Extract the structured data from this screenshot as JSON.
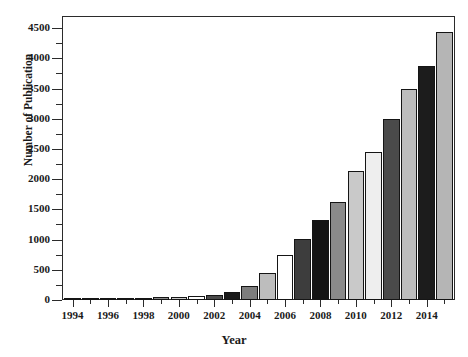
{
  "chart_data": {
    "type": "bar",
    "title": "",
    "xlabel": "Year",
    "ylabel": "Number of Publication",
    "categories": [
      1994,
      1995,
      1996,
      1997,
      1998,
      1999,
      2000,
      2001,
      2002,
      2003,
      2004,
      2005,
      2006,
      2007,
      2008,
      2009,
      2010,
      2011,
      2012,
      2013,
      2014,
      2015
    ],
    "values": [
      10,
      12,
      18,
      22,
      26,
      45,
      55,
      70,
      90,
      130,
      240,
      450,
      750,
      1010,
      1320,
      1620,
      2130,
      2450,
      2990,
      3490,
      3870,
      4430
    ],
    "bar_colors": [
      "#666666",
      "#b3b3b3",
      "#ffffff",
      "#3d3d3d",
      "#111111",
      "#8a8a8a",
      "#c9c9c9",
      "#ffffff",
      "#4a4a4a",
      "#1a1a1a",
      "#7d7d7d",
      "#bdbdbd",
      "#ffffff",
      "#3d3d3d",
      "#141414",
      "#8a8a8a",
      "#c9c9c9",
      "#eeeeee",
      "#4a4a4a",
      "#bdbdbd",
      "#1c1c1c",
      "#b5b5b5"
    ],
    "ylim": [
      0,
      4700
    ],
    "yticks": [
      0,
      500,
      1000,
      1500,
      2000,
      2500,
      3000,
      3500,
      4000,
      4500
    ],
    "ytick_labels": [
      "0",
      "500",
      "1000",
      "1500",
      "2000",
      "2500",
      "3000",
      "3500",
      "4000",
      "4500"
    ],
    "yminor_ticks": [
      250,
      750,
      1250,
      1750,
      2250,
      2750,
      3250,
      3750,
      4250
    ],
    "xticks": [
      1994,
      1996,
      1998,
      2000,
      2002,
      2004,
      2006,
      2008,
      2010,
      2012,
      2014
    ],
    "xtick_labels": [
      "1994",
      "1996",
      "1998",
      "2000",
      "2002",
      "2004",
      "2006",
      "2008",
      "2010",
      "2012",
      "2014"
    ],
    "xlim": [
      1993.4,
      2015.6
    ],
    "grid": false,
    "legend": "none",
    "frame_color": "#2b2b2b",
    "background": "#ffffff"
  }
}
